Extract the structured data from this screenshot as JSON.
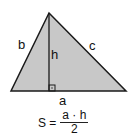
{
  "diagram": {
    "fill_color": "#c8c8c8",
    "stroke_color": "#1a1a1a",
    "vertices": {
      "top": [
        49,
        13
      ],
      "left": [
        11,
        91
      ],
      "right": [
        126,
        91
      ]
    },
    "labels": {
      "side_left": "b",
      "side_right": "c",
      "base": "a",
      "height": "h"
    },
    "formula": {
      "lhs": "S =",
      "numerator": "a · h",
      "denominator": "2"
    }
  }
}
